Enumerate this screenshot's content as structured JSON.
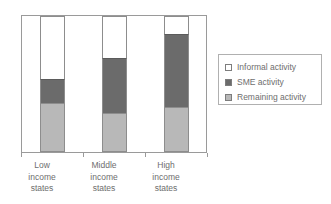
{
  "chart_data": {
    "type": "bar",
    "subtype": "stacked-100-percent",
    "title": "",
    "xlabel": "",
    "ylabel": "",
    "grid": false,
    "ylim": [
      0,
      100
    ],
    "legend_position": "right",
    "categories": [
      "Low income states",
      "Middle income states",
      "High income states"
    ],
    "category_lines": [
      [
        "Low",
        "income",
        "states"
      ],
      [
        "Middle",
        "income",
        "states"
      ],
      [
        "High",
        "income",
        "states"
      ]
    ],
    "series": [
      {
        "name": "Informal activity",
        "color": "#ffffff",
        "values": [
          46,
          31,
          13
        ]
      },
      {
        "name": "SME activity",
        "color": "#6b6b6b",
        "values": [
          18,
          40,
          54
        ]
      },
      {
        "name": "Remaining activity",
        "color": "#b8b8b8",
        "values": [
          36,
          29,
          33
        ]
      }
    ],
    "stack_order_top_to_bottom": [
      "Informal activity",
      "SME activity",
      "Remaining activity"
    ]
  },
  "legend": {
    "items": [
      {
        "label": "Informal activity",
        "swatch": "white-swatch"
      },
      {
        "label": "SME activity",
        "swatch": "dark-gray-swatch"
      },
      {
        "label": "Remaining activity",
        "swatch": "light-gray-swatch"
      }
    ]
  },
  "axis": {
    "tick_count": 4
  },
  "colors": {
    "informal": "#ffffff",
    "sme": "#6b6b6b",
    "remaining": "#b8b8b8",
    "frame": "#9a9a9a",
    "text": "#6e6e6e"
  }
}
